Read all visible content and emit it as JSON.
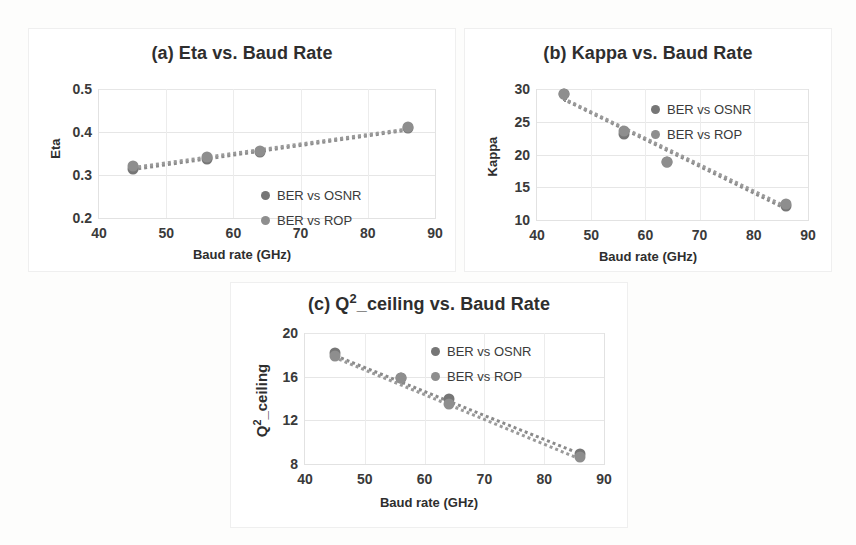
{
  "figure": {
    "background": "#fdfdfc",
    "marker_color_series0": "#767676",
    "marker_color_series1": "#8e8e8e",
    "trendline_style": "dotted"
  },
  "legend_labels": {
    "series0": "BER vs OSNR",
    "series1": "BER vs ROP"
  },
  "shared": {
    "xlabel": "Baud rate (GHz)",
    "xticks": [
      "40",
      "50",
      "60",
      "70",
      "80",
      "90"
    ]
  },
  "chart_data": [
    {
      "id": "a",
      "type": "scatter",
      "title": "(a) Eta vs. Baud Rate",
      "xlabel": "Baud rate (GHz)",
      "ylabel": "Eta",
      "xlim": [
        40,
        90
      ],
      "ylim": [
        0.2,
        0.5
      ],
      "xticks": [
        40,
        50,
        60,
        70,
        80,
        90
      ],
      "yticks": [
        0.2,
        0.3,
        0.4,
        0.5
      ],
      "xticklabels": [
        "40",
        "50",
        "60",
        "70",
        "80",
        "90"
      ],
      "yticklabels": [
        "0.2",
        "0.3",
        "0.4",
        "0.5"
      ],
      "grid": true,
      "legend_position": "center-right",
      "x": [
        45,
        56,
        64,
        86
      ],
      "series": [
        {
          "name": "BER vs OSNR",
          "values": [
            0.313,
            0.338,
            0.354,
            0.409
          ]
        },
        {
          "name": "BER vs ROP",
          "values": [
            0.32,
            0.342,
            0.356,
            0.412
          ]
        }
      ],
      "trendlines": [
        {
          "name": "BER vs OSNR",
          "x": [
            45,
            86
          ],
          "y": [
            0.316,
            0.408
          ]
        },
        {
          "name": "BER vs ROP",
          "x": [
            45,
            86
          ],
          "y": [
            0.321,
            0.411
          ]
        }
      ]
    },
    {
      "id": "b",
      "type": "scatter",
      "title": "(b) Kappa vs. Baud Rate",
      "xlabel": "Baud rate (GHz)",
      "ylabel": "Kappa",
      "xlim": [
        40,
        90
      ],
      "ylim": [
        10,
        30
      ],
      "xticks": [
        40,
        50,
        60,
        70,
        80,
        90
      ],
      "yticks": [
        10,
        15,
        20,
        25,
        30
      ],
      "xticklabels": [
        "40",
        "50",
        "60",
        "70",
        "80",
        "90"
      ],
      "yticklabels": [
        "10",
        "15",
        "20",
        "25",
        "30"
      ],
      "grid": true,
      "legend_position": "upper-right",
      "x": [
        45,
        56,
        64,
        86
      ],
      "series": [
        {
          "name": "BER vs OSNR",
          "values": [
            29.3,
            23.2,
            18.9,
            12.1
          ]
        },
        {
          "name": "BER vs ROP",
          "values": [
            29.3,
            23.6,
            18.9,
            12.5
          ]
        }
      ],
      "trendlines": [
        {
          "name": "BER vs OSNR",
          "x": [
            45,
            86
          ],
          "y": [
            28.6,
            11.9
          ]
        },
        {
          "name": "BER vs ROP",
          "x": [
            45,
            86
          ],
          "y": [
            28.8,
            12.3
          ]
        }
      ]
    },
    {
      "id": "c",
      "type": "scatter",
      "title": "(c) Q²_ceiling vs. Baud Rate",
      "xlabel": "Baud rate (GHz)",
      "ylabel": "Q²_ceiling",
      "xlim": [
        40,
        90
      ],
      "ylim": [
        8,
        20
      ],
      "xticks": [
        40,
        50,
        60,
        70,
        80,
        90
      ],
      "yticks": [
        8,
        12,
        16,
        20
      ],
      "xticklabels": [
        "40",
        "50",
        "60",
        "70",
        "80",
        "90"
      ],
      "yticklabels": [
        "8",
        "12",
        "16",
        "20"
      ],
      "grid": true,
      "legend_position": "upper-right",
      "x": [
        45,
        56,
        64,
        86
      ],
      "series": [
        {
          "name": "BER vs OSNR",
          "values": [
            18.2,
            15.9,
            14.0,
            8.9
          ]
        },
        {
          "name": "BER vs ROP",
          "values": [
            17.9,
            15.9,
            13.5,
            8.6
          ]
        }
      ],
      "trendlines": [
        {
          "name": "BER vs OSNR",
          "x": [
            45,
            86
          ],
          "y": [
            18.1,
            9.1
          ]
        },
        {
          "name": "BER vs ROP",
          "x": [
            45,
            86
          ],
          "y": [
            17.9,
            8.6
          ]
        }
      ]
    }
  ]
}
